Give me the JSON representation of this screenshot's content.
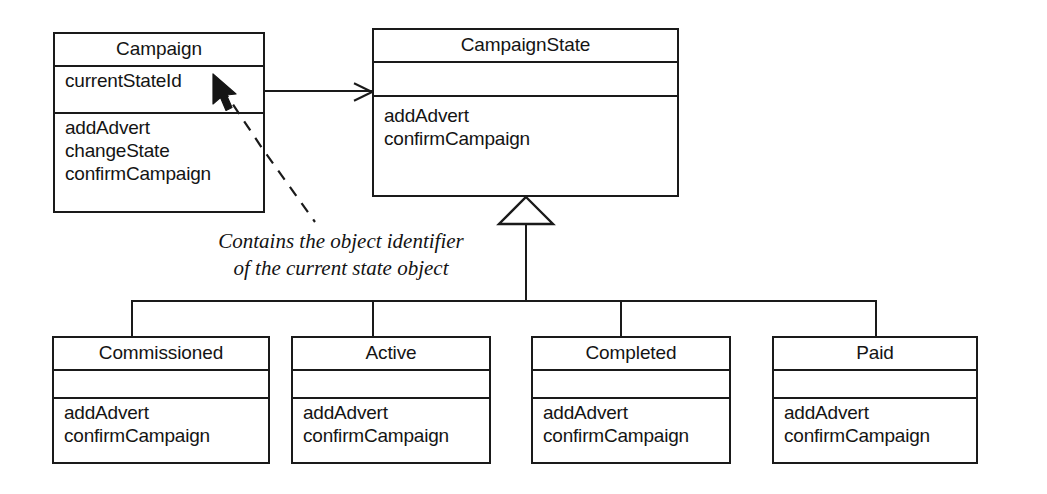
{
  "diagram": {
    "type": "uml-class-diagram",
    "background_color": "#ffffff",
    "line_color": "#1a1a1a",
    "text_color": "#141414"
  },
  "classes": {
    "campaign": {
      "name": "Campaign",
      "attributes": [
        "currentStateId"
      ],
      "operations": [
        "addAdvert",
        "changeState",
        "confirmCampaign"
      ]
    },
    "campaign_state": {
      "name": "CampaignState",
      "attributes": [],
      "operations": [
        "addAdvert",
        "confirmCampaign"
      ]
    },
    "commissioned": {
      "name": "Commissioned",
      "attributes": [],
      "operations": [
        "addAdvert",
        "confirmCampaign"
      ]
    },
    "active": {
      "name": "Active",
      "attributes": [],
      "operations": [
        "addAdvert",
        "confirmCampaign"
      ]
    },
    "completed": {
      "name": "Completed",
      "attributes": [],
      "operations": [
        "addAdvert",
        "confirmCampaign"
      ]
    },
    "paid": {
      "name": "Paid",
      "attributes": [],
      "operations": [
        "addAdvert",
        "confirmCampaign"
      ]
    }
  },
  "annotation": {
    "line1": "Contains the object identifier",
    "line2": "of the current state object",
    "style": "italic-serif",
    "points_to": "currentStateId"
  },
  "relationships": {
    "association": {
      "kind": "navigable-association",
      "from": "Campaign",
      "to": "CampaignState",
      "arrowhead": "open-stick"
    },
    "generalization": {
      "kind": "generalization",
      "parent": "CampaignState",
      "children": [
        "Commissioned",
        "Active",
        "Completed",
        "Paid"
      ],
      "arrowhead": "hollow-triangle"
    }
  },
  "cursor": {
    "kind": "mouse-pointer",
    "target": "currentStateId"
  }
}
